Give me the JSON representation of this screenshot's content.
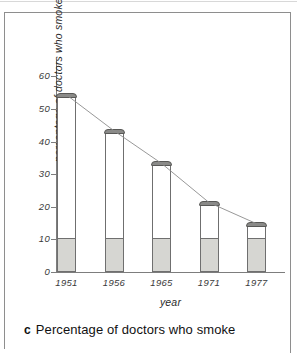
{
  "caption": {
    "letter": "c",
    "text": "Percentage of doctors who smoke"
  },
  "chart_data": {
    "type": "bar",
    "title": "",
    "xlabel": "year",
    "ylabel": "percentage of doctors who smoke",
    "categories": [
      "1951",
      "1956",
      "1965",
      "1971",
      "1977"
    ],
    "values": [
      54,
      43,
      33,
      21,
      14.5
    ],
    "ylim": [
      0,
      65
    ],
    "yticks": [
      0,
      10,
      20,
      30,
      40,
      50,
      60
    ],
    "ytick_labels": [
      "0",
      "10",
      "20",
      "30",
      "40",
      "50",
      "60"
    ],
    "grid": false,
    "legend": "none",
    "series": [
      {
        "name": "percentage of doctors who smoke",
        "values": [
          54,
          43,
          33,
          21,
          14.5
        ]
      }
    ],
    "annotations": {
      "bar_style": "cigarette: white body, dark grey ash cap, stippled grey filter base",
      "filter_base_value": 10.5,
      "trend_line": "line connecting bar tops"
    },
    "colors": {
      "bar_body": "#ffffff",
      "bar_cap": "#8a8a88",
      "bar_base": "#d6d6d2",
      "outline": "#6f6f6f",
      "axis": "#7d7d7d",
      "text": "#2b2b2b"
    }
  }
}
